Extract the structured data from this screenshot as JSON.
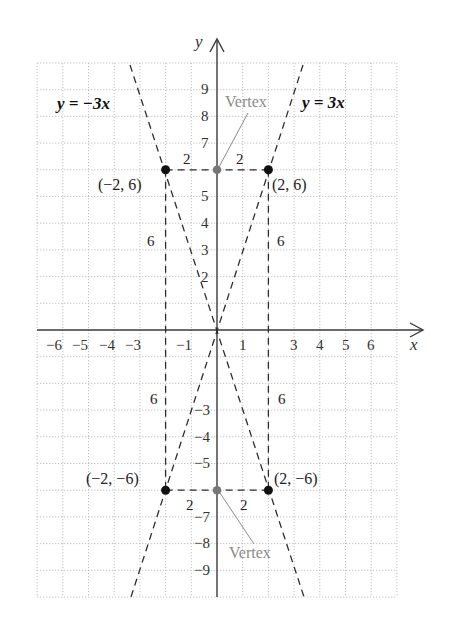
{
  "diagram": {
    "type": "coordinate-plane-graph",
    "axes": {
      "x_name": "x",
      "y_name": "y",
      "x_ticks": [
        "−6",
        "−5",
        "−4",
        "−3",
        "−1",
        "1",
        "3",
        "4",
        "5",
        "6"
      ],
      "y_ticks_positive": [
        "2",
        "3",
        "4",
        "5",
        "7",
        "8",
        "9"
      ],
      "y_ticks_negative": [
        "−3",
        "−4",
        "−5",
        "−7",
        "−8",
        "−9"
      ]
    },
    "lines": [
      {
        "equation": "y = −3x",
        "style": "dashed"
      },
      {
        "equation": "y = 3x",
        "style": "dashed"
      }
    ],
    "points": [
      {
        "label": "(−2, 6)",
        "x": -2,
        "y": 6
      },
      {
        "label": "(2, 6)",
        "x": 2,
        "y": 6
      },
      {
        "label": "(−2, −6)",
        "x": -2,
        "y": -6
      },
      {
        "label": "(2, −6)",
        "x": 2,
        "y": -6
      }
    ],
    "vertices": [
      {
        "label": "Vertex",
        "x": 0,
        "y": 6
      },
      {
        "label": "Vertex",
        "x": 0,
        "y": -6
      }
    ],
    "distance_labels": {
      "top_left": "2",
      "top_right": "2",
      "bottom_left": "2",
      "bottom_right": "2",
      "upper_left_vertical": "6",
      "upper_right_vertical": "6",
      "lower_left_vertical": "6",
      "lower_right_vertical": "6"
    },
    "colors": {
      "grid": "#b8b8b8",
      "axis": "#3a3a3a",
      "point": "#111111",
      "vertex": "#777777",
      "vertex_label": "#8a8a8a"
    }
  }
}
